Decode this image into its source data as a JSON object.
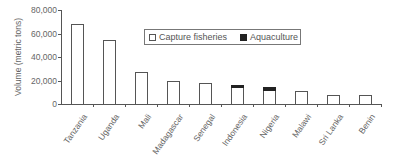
{
  "chart_data": {
    "type": "bar",
    "stacked": true,
    "title": "",
    "xlabel": "",
    "ylabel": "Volume (metric tons)",
    "ylim": [
      0,
      80000
    ],
    "yticks": [
      0,
      20000,
      40000,
      60000,
      80000
    ],
    "ytick_labels": [
      "0",
      "20,000",
      "40,000",
      "60,000",
      "80,000"
    ],
    "categories": [
      "Tanzania",
      "Uganda",
      "Mali",
      "Madagascar",
      "Senegal",
      "Indonesia",
      "Nigeria",
      "Malawi",
      "Sri Lanka",
      "Benin"
    ],
    "series": [
      {
        "name": "Capture fisheries",
        "color": "#ffffff",
        "values": [
          68000,
          54500,
          27000,
          19800,
          17600,
          14200,
          12200,
          11300,
          7900,
          7700
        ]
      },
      {
        "name": "Aquaculture",
        "color": "#222222",
        "values": [
          0,
          0,
          0,
          0,
          0,
          2000,
          2300,
          0,
          0,
          0
        ]
      }
    ],
    "grid": false,
    "legend_position": "top-right (inside)",
    "xtick_rotation": -55
  },
  "legend": {
    "items": [
      {
        "label": "Capture fisheries"
      },
      {
        "label": "Aquaculture"
      }
    ]
  }
}
